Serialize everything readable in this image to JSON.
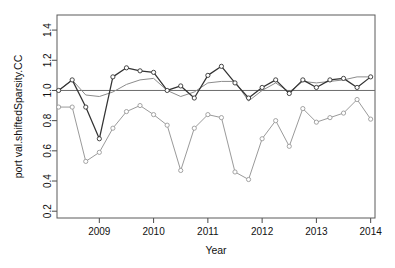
{
  "chart_data": {
    "type": "line",
    "title": "",
    "xlabel": "Year",
    "ylabel": "port val.shiftedSparsity.CC",
    "xlim": [
      2008.22,
      2014.08
    ],
    "ylim": [
      0.155,
      1.5
    ],
    "xticks": [
      2009,
      2010,
      2011,
      2012,
      2013,
      2014
    ],
    "xticklabels": [
      "2009",
      "2010",
      "2011",
      "2012",
      "2013",
      "2014"
    ],
    "yticks": [
      0.2,
      0.4,
      0.6,
      0.8,
      1.0,
      1.2,
      1.4
    ],
    "yticklabels": [
      "0.2",
      "0.4",
      "0.6",
      "0.8",
      "1.0",
      "1.2",
      "1.4"
    ],
    "grid": false,
    "legend": "none",
    "reference_line": {
      "y": 1.0,
      "color": "#6b6b6b",
      "orientation": "horizontal"
    },
    "x": [
      2008.25,
      2008.5,
      2008.75,
      2009.0,
      2009.25,
      2009.5,
      2009.75,
      2010.0,
      2010.25,
      2010.5,
      2010.75,
      2011.0,
      2011.25,
      2011.5,
      2011.75,
      2012.0,
      2012.25,
      2012.5,
      2012.75,
      2013.0,
      2013.25,
      2013.5,
      2013.75,
      2014.0
    ],
    "series": [
      {
        "name": "portfolio-dark",
        "color": "#333333",
        "marker": "circle",
        "values": [
          1.0,
          1.07,
          0.89,
          0.68,
          1.09,
          1.15,
          1.13,
          1.12,
          1.0,
          1.03,
          0.95,
          1.1,
          1.16,
          1.05,
          0.95,
          1.02,
          1.07,
          0.98,
          1.07,
          1.02,
          1.07,
          1.08,
          1.02,
          1.09
        ]
      },
      {
        "name": "benchmark-smooth-grey",
        "color": "#8c8c8c",
        "marker": "none",
        "values": [
          1.0,
          1.07,
          0.97,
          0.96,
          0.99,
          1.04,
          1.07,
          1.08,
          1.0,
          0.96,
          0.99,
          1.05,
          1.06,
          1.06,
          0.93,
          1.0,
          1.05,
          0.99,
          1.06,
          1.05,
          1.06,
          1.07,
          1.09,
          1.09
        ]
      },
      {
        "name": "sparsity-lower-grey",
        "color": "#9a9a9a",
        "marker": "circle",
        "values": [
          0.89,
          0.89,
          0.53,
          0.59,
          0.75,
          0.86,
          0.9,
          0.84,
          0.77,
          0.47,
          0.75,
          0.84,
          0.82,
          0.46,
          0.41,
          0.68,
          0.8,
          0.63,
          0.88,
          0.79,
          0.82,
          0.85,
          0.94,
          0.81
        ]
      }
    ]
  }
}
